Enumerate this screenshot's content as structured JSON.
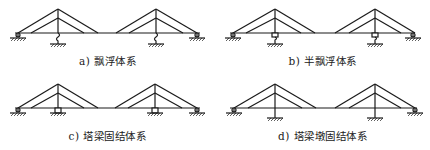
{
  "figure": {
    "panels": [
      {
        "id": "a",
        "caption": "a) 飘浮体系",
        "system": "floating",
        "tower_connection": "spring-hanger"
      },
      {
        "id": "b",
        "caption": "b) 半飘浮体系",
        "system": "semi-floating",
        "tower_connection": "bearing-with-spring"
      },
      {
        "id": "c",
        "caption": "c) 塔梁固结体系",
        "system": "tower-girder-fixed",
        "tower_connection": "bearing"
      },
      {
        "id": "d",
        "caption": "d) 塔梁墩固结体系",
        "system": "tower-girder-pier-fixed",
        "tower_connection": "rigid"
      }
    ],
    "colors": {
      "line": "#1a1a1a",
      "background": "#ffffff"
    }
  }
}
